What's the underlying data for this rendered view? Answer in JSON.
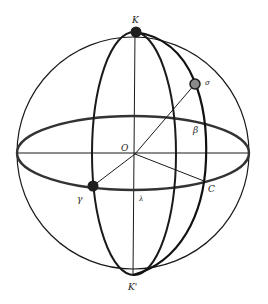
{
  "diagram": {
    "labels": {
      "north_pole": "K",
      "south_pole": "K'",
      "center": "O",
      "star": "σ",
      "latitude_angle": "β",
      "point_c": "C",
      "vernal_equinox": "γ",
      "longitude_angle": "λ"
    },
    "colors": {
      "stroke": "#1a1a1a",
      "star_fill": "#8a8a8a",
      "pole_fill": "#1f1f1f",
      "background": "#ffffff"
    }
  }
}
